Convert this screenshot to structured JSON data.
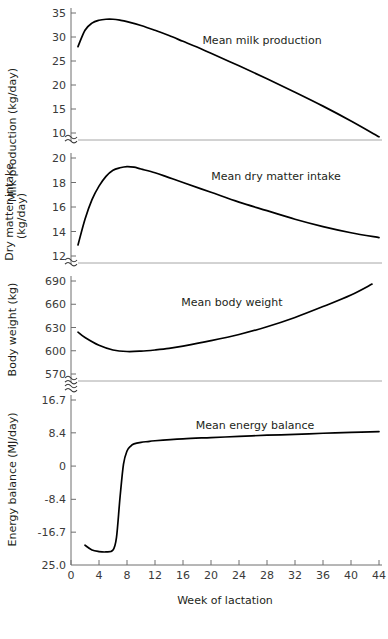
{
  "figure": {
    "xlabel": "Week of lactation",
    "x_ticks": [
      0,
      4,
      8,
      12,
      16,
      20,
      24,
      28,
      32,
      36,
      40,
      44
    ],
    "xlim": [
      0,
      44
    ],
    "break_symbol": "≈",
    "line_color": "#000000",
    "axis_color": "#6e6e6e"
  },
  "chart_data": [
    {
      "type": "line",
      "title": "",
      "annotation": "Mean milk production",
      "xlabel": "Week of lactation",
      "ylabel": "Milk production (kg/day)",
      "xlim": [
        0,
        44
      ],
      "ylim": [
        10,
        35
      ],
      "y_ticks": [
        35,
        30,
        25,
        20,
        15,
        10
      ],
      "grid": false,
      "axis_break_below": true,
      "x": [
        1,
        2,
        3,
        4,
        5,
        6,
        7,
        8,
        10,
        12,
        14,
        16,
        18,
        20,
        24,
        28,
        32,
        36,
        40,
        44
      ],
      "values": [
        28.0,
        31.4,
        32.9,
        33.5,
        33.7,
        33.7,
        33.5,
        33.2,
        32.4,
        31.4,
        30.3,
        29.1,
        27.9,
        26.6,
        24.0,
        21.3,
        18.5,
        15.6,
        12.5,
        9.2
      ]
    },
    {
      "type": "line",
      "title": "",
      "annotation": "Mean dry matter intake",
      "xlabel": "Week of lactation",
      "ylabel": "Dry matter intake (kg/day)",
      "xlim": [
        0,
        44
      ],
      "ylim": [
        12,
        20
      ],
      "y_ticks": [
        20,
        18,
        16,
        14,
        12
      ],
      "grid": false,
      "axis_break_below": true,
      "x": [
        1,
        2,
        3,
        4,
        5,
        6,
        7,
        8,
        9,
        10,
        12,
        14,
        16,
        20,
        24,
        28,
        32,
        36,
        40,
        44
      ],
      "values": [
        12.9,
        15.0,
        16.6,
        17.7,
        18.5,
        19.0,
        19.2,
        19.3,
        19.25,
        19.1,
        18.8,
        18.4,
        18.0,
        17.2,
        16.4,
        15.7,
        15.0,
        14.4,
        13.9,
        13.5
      ]
    },
    {
      "type": "line",
      "title": "",
      "annotation": "Mean body weight",
      "xlabel": "Week of lactation",
      "ylabel": "Body weight (kg)",
      "xlim": [
        0,
        44
      ],
      "ylim": [
        570,
        690
      ],
      "y_ticks": [
        690,
        660,
        630,
        600,
        570
      ],
      "grid": false,
      "axis_break_below": true,
      "x": [
        1,
        2,
        4,
        6,
        8,
        10,
        12,
        14,
        16,
        20,
        24,
        28,
        32,
        36,
        40,
        43
      ],
      "values": [
        624,
        617,
        607,
        601,
        599,
        599.5,
        601,
        603,
        606,
        613,
        621,
        631,
        643,
        657,
        672,
        686
      ]
    },
    {
      "type": "line",
      "title": "",
      "annotation": "Mean energy balance",
      "xlabel": "Week of lactation",
      "ylabel": "Energy balance (MJ/day)",
      "xlim": [
        0,
        44
      ],
      "ylim": [
        -25.0,
        16.7
      ],
      "y_ticks": [
        16.7,
        8.4,
        0,
        -8.4,
        -16.7
      ],
      "y_bottom_label": "25.0",
      "grid": false,
      "axis_break_above": true,
      "x": [
        2,
        3,
        4,
        5,
        6,
        6.5,
        7,
        7.5,
        8,
        8.5,
        9,
        10,
        11,
        12,
        16,
        20,
        24,
        28,
        32,
        36,
        40,
        44
      ],
      "values": [
        -20.0,
        -21.2,
        -21.6,
        -21.7,
        -21.2,
        -18.0,
        -8.0,
        0.5,
        3.8,
        5.0,
        5.6,
        6.0,
        6.2,
        6.4,
        6.9,
        7.2,
        7.5,
        7.8,
        8.0,
        8.3,
        8.5,
        8.7
      ]
    }
  ]
}
